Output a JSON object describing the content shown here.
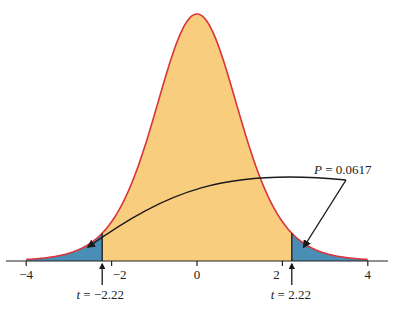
{
  "chart_data": {
    "type": "area",
    "title": "",
    "distribution": "t",
    "xlabel": "",
    "ylabel": "",
    "xlim": [
      -4,
      4
    ],
    "x_ticks": [
      -4,
      -2,
      0,
      2,
      4
    ],
    "x_tick_labels": [
      "−4",
      "−2",
      "0",
      "2",
      "4"
    ],
    "grid": false,
    "critical_values": [
      -2.22,
      2.22
    ],
    "critical_labels": [
      {
        "var": "t",
        "text": " = −2.22",
        "value": -2.22
      },
      {
        "var": "t",
        "text": " = 2.22",
        "value": 2.22
      }
    ],
    "annotation": {
      "var": "P",
      "text": " = 0.0617",
      "value": 0.0617
    },
    "colors": {
      "body_fill": "#F8CD7E",
      "tail_fill": "#4A8DB5",
      "curve_stroke": "#D9343A",
      "axis": "#222222",
      "arrow": "#1a1a1a"
    }
  },
  "layout": {
    "axis_y": 261,
    "x0_px": 197,
    "px_per_unit": 42.7,
    "peak_y": 14,
    "df": 9
  }
}
